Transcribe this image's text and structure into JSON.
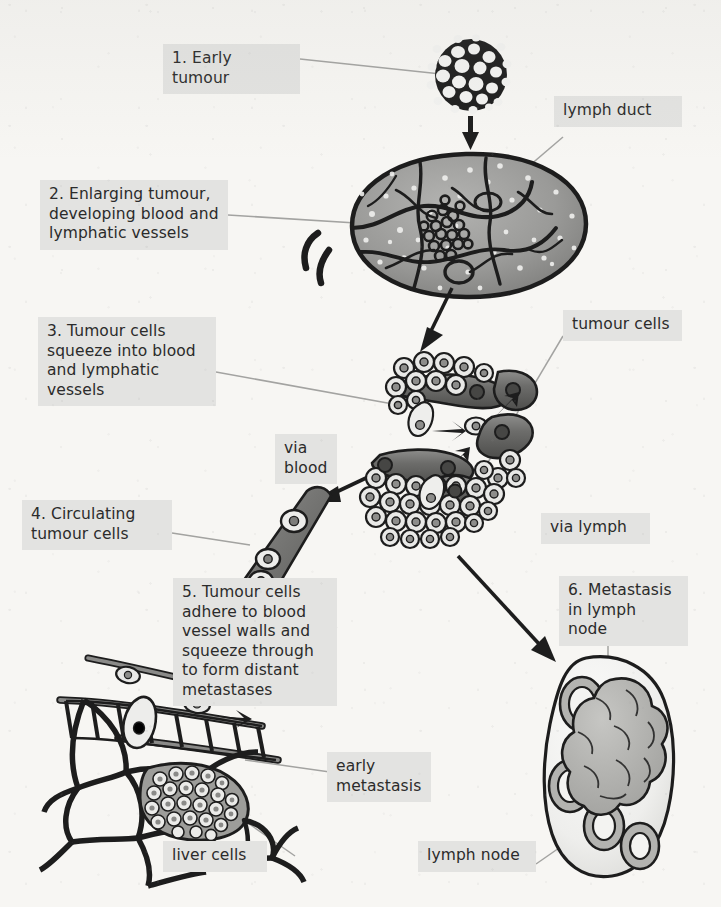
{
  "figure": {
    "background_color": "#f7f6f3",
    "label_box_color": "#e3e3e1",
    "ink_color": "#1d1d1d",
    "leader_line_color": "#9a9a9a"
  },
  "labels": {
    "step1": "1. Early tumour",
    "step2": "2. Enlarging tumour,\ndeveloping blood and\nlymphatic vessels",
    "step3": "3. Tumour cells\nsqueeze into blood\nand lymphatic vessels",
    "step4": "4. Circulating\ntumour cells",
    "step5": "5. Tumour cells\nadhere to blood\nvessel walls and\nsqueeze through\nto form distant\nmetastases",
    "step6": "6. Metastasis\nin lymph node",
    "lymph_duct": "lymph duct",
    "tumour_cells": "tumour cells",
    "via_blood": "via\nblood",
    "via_lymph": "via lymph",
    "early_metastasis": "early\nmetastasis",
    "liver_cells": "liver cells",
    "lymph_node": "lymph node"
  },
  "steps": [
    {
      "number": "1",
      "label": "1. Early tumour",
      "structure": "early-tumour-cluster"
    },
    {
      "number": "2",
      "label": "2. Enlarging tumour, developing blood and lymphatic vessels",
      "structure": "vascularised-tumour-mass"
    },
    {
      "number": "3",
      "label": "3. Tumour cells squeeze into blood and lymphatic vessels",
      "structure": "intravasation-cell-groups"
    },
    {
      "number": "4",
      "label": "4. Circulating tumour cells",
      "structure": "blood-vessel-tube-with-cells"
    },
    {
      "number": "5",
      "label": "5. Tumour cells adhere to blood vessel walls and squeeze through to form distant metastases",
      "structure": "liver-cell-network"
    },
    {
      "number": "6",
      "label": "6. Metastasis in lymph node",
      "structure": "lymph-node-with-follicles"
    }
  ],
  "annotations": [
    {
      "name": "lymph duct",
      "points_to": "vessel stub on upper right of enlarging tumour"
    },
    {
      "name": "tumour cells",
      "points_to": "cell cluster edge in intravasation panel"
    },
    {
      "name": "via blood",
      "points_to": "arrow into circulating vessel"
    },
    {
      "name": "via lymph",
      "points_to": "arrow toward lymph node"
    },
    {
      "name": "early metastasis",
      "points_to": "dense cell cluster inside liver tissue"
    },
    {
      "name": "liver cells",
      "points_to": "polygonal hepatocyte network"
    },
    {
      "name": "lymph node",
      "points_to": "outline of lymph node"
    }
  ]
}
